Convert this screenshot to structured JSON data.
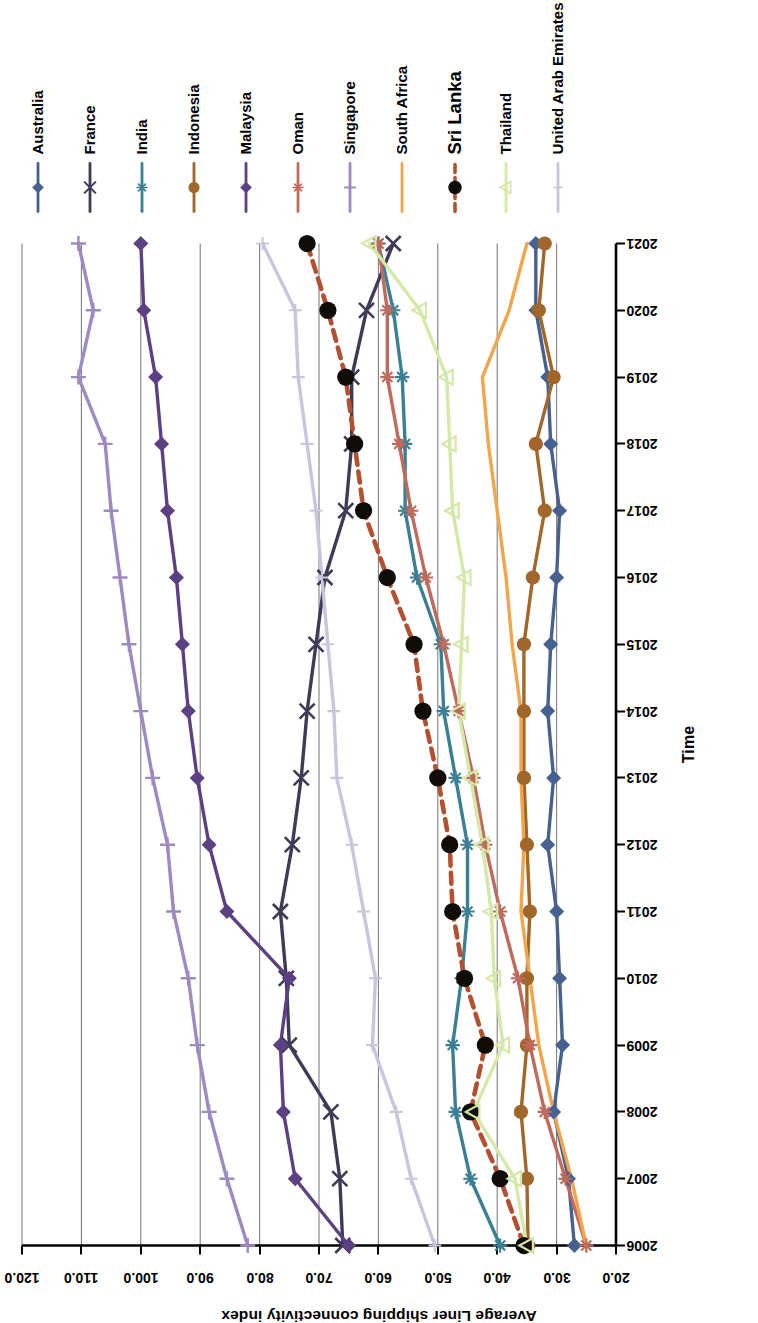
{
  "chart_data": {
    "type": "line",
    "title": "",
    "xlabel": "Time",
    "ylabel": "Average Liner shipping connectivity index",
    "x": [
      2006,
      2007,
      2008,
      2009,
      2010,
      2011,
      2012,
      2013,
      2014,
      2015,
      2016,
      2017,
      2018,
      2019,
      2020,
      2021
    ],
    "xlim": [
      2006,
      2021
    ],
    "ylim": [
      20.0,
      120.0
    ],
    "ytick_labels": [
      "120.0",
      "110.0",
      "100.0",
      "90.0",
      "80.0",
      "70.0",
      "60.0",
      "50.0",
      "40.0",
      "30.0",
      "20.0"
    ],
    "yticks": [
      120,
      110,
      100,
      90,
      80,
      70,
      60,
      50,
      40,
      30,
      20
    ],
    "grid": "horizontal-value-gridlines",
    "legend_position": "right",
    "rotation_note": "chart rendered rotated 90 degrees (portrait page)",
    "series": [
      {
        "name": "Australia",
        "color": "#46618f",
        "marker": "diamond",
        "dash": "solid",
        "values": [
          27.0,
          28.0,
          30.5,
          29.0,
          29.5,
          30.0,
          31.5,
          30.5,
          31.5,
          31.0,
          30.0,
          29.5,
          31.0,
          31.5,
          33.5,
          33.5
        ]
      },
      {
        "name": "France",
        "color": "#3f3a57",
        "marker": "x",
        "dash": "solid",
        "values": [
          66.0,
          66.5,
          68.0,
          75.0,
          75.5,
          76.5,
          74.5,
          73.0,
          72.0,
          70.5,
          69.0,
          65.5,
          64.5,
          64.5,
          62.0,
          57.5
        ]
      },
      {
        "name": "India",
        "color": "#3b7f94",
        "marker": "asterisk",
        "dash": "solid",
        "values": [
          39.5,
          44.5,
          47.0,
          47.5,
          46.0,
          45.0,
          45.0,
          47.0,
          49.0,
          49.5,
          53.5,
          55.5,
          55.5,
          56.0,
          57.5,
          60.0
        ]
      },
      {
        "name": "Indonesia",
        "color": "#a0662a",
        "marker": "circle",
        "dash": "solid",
        "values": [
          34.8,
          35.0,
          36.0,
          35.0,
          35.0,
          34.5,
          35.0,
          35.5,
          35.5,
          35.5,
          34.0,
          32.0,
          33.5,
          30.5,
          33.0,
          32.0
        ]
      },
      {
        "name": "Malaysia",
        "color": "#5d3f84",
        "marker": "diamond",
        "dash": "solid",
        "values": [
          65.0,
          74.0,
          76.0,
          76.5,
          75.0,
          85.5,
          88.5,
          90.5,
          92.0,
          93.0,
          94.0,
          95.5,
          96.5,
          97.5,
          99.5,
          100.0
        ]
      },
      {
        "name": "Oman",
        "color": "#c06a5b",
        "marker": "asterisk",
        "dash": "solid",
        "values": [
          25.0,
          28.5,
          32.0,
          34.5,
          36.5,
          39.5,
          42.0,
          44.0,
          46.5,
          49.0,
          52.0,
          54.5,
          56.5,
          58.5,
          58.5,
          60.0
        ]
      },
      {
        "name": "Singapore",
        "color": "#9d8ac2",
        "marker": "plus",
        "dash": "solid",
        "values": [
          82.0,
          85.5,
          88.5,
          90.5,
          92.0,
          94.5,
          95.5,
          98.0,
          100.0,
          102.0,
          103.5,
          105.0,
          106.0,
          110.5,
          108.0,
          110.5
        ]
      },
      {
        "name": "South Africa",
        "color": "#f2a54a",
        "marker": "none",
        "dash": "solid",
        "values": [
          25.0,
          27.5,
          30.5,
          33.0,
          34.5,
          36.0,
          35.5,
          36.0,
          36.0,
          37.5,
          38.5,
          40.0,
          41.5,
          42.5,
          38.0,
          35.0
        ]
      },
      {
        "name": "Sri Lanka",
        "color": "#b4502f",
        "marker": "circle-black",
        "dash": "dashed",
        "emphasis": true,
        "values": [
          35.5,
          39.5,
          44.5,
          42.0,
          45.5,
          47.5,
          48.0,
          50.0,
          52.5,
          54.0,
          58.5,
          62.5,
          64.0,
          65.5,
          68.5,
          72.0
        ]
      },
      {
        "name": "Thailand",
        "color": "#d4e8a8",
        "marker": "triangle",
        "dash": "solid",
        "values": [
          35.0,
          37.0,
          44.0,
          39.0,
          40.5,
          41.0,
          42.5,
          44.5,
          46.5,
          46.0,
          45.5,
          47.5,
          48.0,
          48.5,
          53.0,
          61.5
        ]
      },
      {
        "name": "United Arab Emirates",
        "color": "#c7c6dd",
        "marker": "plus-small",
        "dash": "solid",
        "values": [
          50.5,
          54.5,
          57.0,
          61.0,
          60.5,
          62.5,
          64.5,
          67.0,
          67.5,
          68.5,
          69.5,
          70.5,
          72.0,
          73.5,
          74.0,
          79.5
        ]
      }
    ]
  },
  "axes": {
    "value_axis_title": "Average Liner shipping connectivity index",
    "time_axis_title": "Time"
  }
}
